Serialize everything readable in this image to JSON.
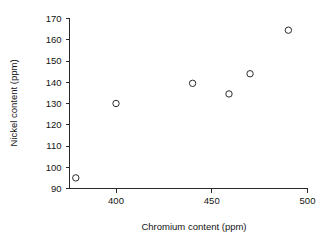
{
  "chart_data": {
    "type": "scatter",
    "title": "",
    "xlabel": "Chromium content (ppm)",
    "ylabel": "Nickel content (ppm)",
    "xlim": [
      372,
      502
    ],
    "ylim": [
      90,
      170
    ],
    "grid": false,
    "legend": null,
    "xticks": [
      400,
      450,
      500
    ],
    "xtick_labels": [
      "400",
      "450",
      "500"
    ],
    "yticks": [
      90,
      100,
      110,
      120,
      130,
      140,
      150,
      160,
      170
    ],
    "ytick_labels": [
      "90",
      "100",
      "110",
      "120",
      "130",
      "140",
      "150",
      "160",
      "170"
    ],
    "marker": "open-circle",
    "marker_color": "#2b2b2b",
    "points": [
      {
        "x": 379,
        "y": 95
      },
      {
        "x": 400,
        "y": 130
      },
      {
        "x": 440,
        "y": 139.5
      },
      {
        "x": 459,
        "y": 134.5
      },
      {
        "x": 470,
        "y": 144
      },
      {
        "x": 490,
        "y": 164.5
      }
    ]
  },
  "axes": {
    "x_label": "Chromium content (ppm)",
    "y_label": "Nickel content (ppm)"
  }
}
